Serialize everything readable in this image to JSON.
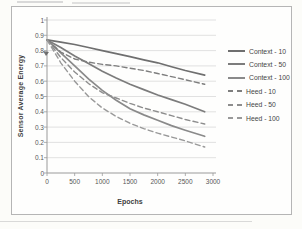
{
  "page": {
    "background_color": "#fcfcf9",
    "frame_border_color": "#b5b5b5"
  },
  "chart_data": {
    "type": "line",
    "title": "",
    "ylabel": "Sensor Average Energy",
    "xlabel": "Epochs",
    "xlim": [
      0,
      3000
    ],
    "ylim": [
      0,
      1
    ],
    "x_tick_values": [
      0,
      500,
      1000,
      1500,
      2000,
      2500,
      3000
    ],
    "x_tick_labels": [
      "0",
      "500",
      "1000",
      "1500",
      "2000",
      "2500",
      "3000"
    ],
    "y_tick_values": [
      1,
      0.9,
      0.8,
      0.7,
      0.6,
      0.5,
      0.4,
      0.3,
      0.2,
      0.1,
      0
    ],
    "y_tick_labels": [
      "1",
      "0.9",
      "0.8",
      "0.7",
      "0.6",
      "0.5",
      "0.4",
      "0.3",
      "0.2",
      "0.1",
      "0"
    ],
    "grid": "horizontal",
    "grid_color": "#d9d9d9",
    "axis_color": "#9a9a9a",
    "text_color": "#4d4d4d",
    "legend_position": "right-outside",
    "x": [
      0,
      250,
      500,
      750,
      1000,
      1250,
      1500,
      1750,
      2000,
      2250,
      2500,
      2850
    ],
    "series": [
      {
        "name": "Context - 10",
        "line_style": "solid",
        "color": "#6f6f6f",
        "values": [
          0.87,
          0.855,
          0.84,
          0.82,
          0.8,
          0.78,
          0.76,
          0.74,
          0.72,
          0.695,
          0.67,
          0.64
        ]
      },
      {
        "name": "Context - 50",
        "line_style": "solid",
        "color": "#7c7c7c",
        "values": [
          0.87,
          0.82,
          0.765,
          0.715,
          0.665,
          0.62,
          0.58,
          0.545,
          0.51,
          0.48,
          0.45,
          0.4
        ]
      },
      {
        "name": "Context - 100",
        "line_style": "solid",
        "color": "#8a8a8a",
        "values": [
          0.87,
          0.785,
          0.7,
          0.615,
          0.54,
          0.475,
          0.42,
          0.38,
          0.345,
          0.31,
          0.28,
          0.24
        ]
      },
      {
        "name": "Heed - 10",
        "line_style": "dashed",
        "color": "#7e7e7e",
        "values": [
          0.87,
          0.79,
          0.745,
          0.725,
          0.71,
          0.7,
          0.685,
          0.67,
          0.65,
          0.63,
          0.61,
          0.58
        ]
      },
      {
        "name": "Heed - 50",
        "line_style": "dashed",
        "color": "#8d8d8d",
        "values": [
          0.87,
          0.755,
          0.66,
          0.585,
          0.525,
          0.49,
          0.455,
          0.425,
          0.4,
          0.375,
          0.35,
          0.32
        ]
      },
      {
        "name": "Heed - 100",
        "line_style": "dashed",
        "color": "#999999",
        "values": [
          0.87,
          0.72,
          0.6,
          0.5,
          0.425,
          0.37,
          0.325,
          0.29,
          0.26,
          0.235,
          0.21,
          0.17
        ]
      }
    ]
  }
}
